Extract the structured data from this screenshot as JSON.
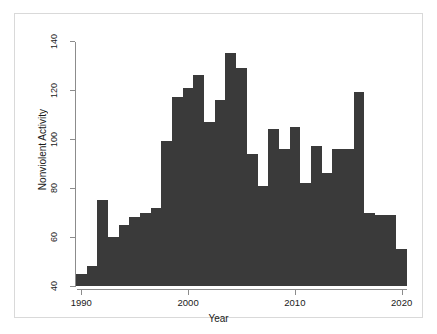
{
  "chart_data": {
    "type": "bar",
    "title": "",
    "subtitle": "",
    "xlabel": "Year",
    "ylabel": "Nonviolent Activity",
    "xlim": [
      1989.5,
      2020.5
    ],
    "ylim": [
      40,
      140
    ],
    "grid": false,
    "legend": null,
    "bar_color": "#3a3a3a",
    "axis_color": "#8c8c8c",
    "note": "Histogram-style bars, one per year; y-axis is truncated at 40 so bars are drawn from 40 upward.",
    "xticks": [
      1990,
      2000,
      2010,
      2020
    ],
    "xtick_labels": [
      "1990",
      "2000",
      "2010",
      "2020"
    ],
    "yticks": [
      40,
      60,
      80,
      100,
      120,
      140
    ],
    "ytick_labels": [
      "40",
      "60",
      "80",
      "100",
      "120",
      "140"
    ],
    "categories": [
      1990,
      1991,
      1992,
      1993,
      1994,
      1995,
      1996,
      1997,
      1998,
      1999,
      2000,
      2001,
      2002,
      2003,
      2004,
      2005,
      2006,
      2007,
      2008,
      2009,
      2010,
      2011,
      2012,
      2013,
      2014,
      2015,
      2016,
      2017,
      2018,
      2019,
      2020
    ],
    "values": [
      45,
      48,
      75,
      60,
      65,
      68,
      70,
      72,
      99,
      117,
      121,
      126,
      107,
      116,
      135,
      129,
      94,
      81,
      104,
      96,
      105,
      82,
      97,
      86,
      96,
      96,
      119,
      70,
      69,
      69,
      55
    ]
  },
  "axes": {
    "ylabel": "Nonviolent Activity",
    "xlabel": "Year"
  }
}
